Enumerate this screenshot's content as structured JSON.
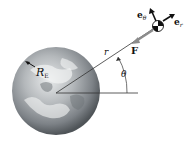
{
  "figure": {
    "type": "orbital-mechanics-diagram",
    "labels": {
      "radius_symbol": "R",
      "radius_subscript": "E",
      "distance": "r",
      "angle": "θ",
      "force": "F",
      "unit_theta_base": "e",
      "unit_theta_sub": "θ",
      "unit_r_base": "e",
      "unit_r_sub": "r"
    },
    "colors": {
      "line": "#333333",
      "force_arrow": "#8c8c8c",
      "earth_light": "#d8dadb",
      "earth_dark": "#5c6166"
    }
  }
}
